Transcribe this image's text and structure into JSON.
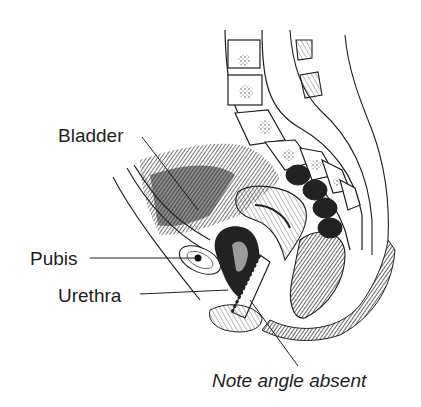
{
  "diagram": {
    "type": "anatomical sagittal section (female pelvis)",
    "labels": {
      "bladder": "Bladder",
      "pubis": "Pubis",
      "urethra": "Urethra",
      "note": "Note angle absent"
    },
    "colors": {
      "ink": "#1e1e1e",
      "background": "#ffffff",
      "shade": "#3a3a3a"
    }
  }
}
